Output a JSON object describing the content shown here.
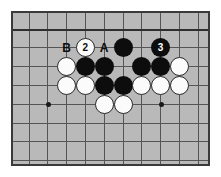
{
  "diagram": {
    "kind": "go-board-diagram",
    "board": {
      "background_color": "#b9b9b9",
      "line_color": "#555555",
      "edge_line_color": "#2e2e2e",
      "frame_color": "#3a3a3a",
      "cell_size": 18.8,
      "origin_x": 16,
      "origin_y": 16,
      "columns": 10,
      "rows": 8,
      "top_edge_is_board_edge": true,
      "left_edge_is_board_edge": false
    },
    "star_points": [
      {
        "col": 1,
        "row": 4
      },
      {
        "col": 7,
        "row": 4
      }
    ],
    "stones": [
      {
        "col": 5,
        "row": 1,
        "color": "black",
        "label": ""
      },
      {
        "col": 7,
        "row": 1,
        "color": "black",
        "label": "3"
      },
      {
        "col": 3,
        "row": 1,
        "color": "white",
        "label": "2"
      },
      {
        "col": 2,
        "row": 2,
        "color": "white",
        "label": ""
      },
      {
        "col": 3,
        "row": 2,
        "color": "black",
        "label": ""
      },
      {
        "col": 4,
        "row": 2,
        "color": "black",
        "label": ""
      },
      {
        "col": 6,
        "row": 2,
        "color": "black",
        "label": ""
      },
      {
        "col": 7,
        "row": 2,
        "color": "black",
        "label": ""
      },
      {
        "col": 8,
        "row": 2,
        "color": "white",
        "label": ""
      },
      {
        "col": 2,
        "row": 3,
        "color": "white",
        "label": ""
      },
      {
        "col": 3,
        "row": 3,
        "color": "white",
        "label": ""
      },
      {
        "col": 4,
        "row": 3,
        "color": "black",
        "label": ""
      },
      {
        "col": 5,
        "row": 3,
        "color": "black",
        "label": ""
      },
      {
        "col": 6,
        "row": 3,
        "color": "white",
        "label": ""
      },
      {
        "col": 7,
        "row": 3,
        "color": "white",
        "label": ""
      },
      {
        "col": 8,
        "row": 3,
        "color": "white",
        "label": ""
      },
      {
        "col": 4,
        "row": 4,
        "color": "white",
        "label": ""
      },
      {
        "col": 5,
        "row": 4,
        "color": "white",
        "label": ""
      }
    ],
    "point_labels": [
      {
        "col": 2,
        "row": 1,
        "text": "B"
      },
      {
        "col": 4,
        "row": 1,
        "text": "A"
      }
    ],
    "move_numbers": {
      "two": "2",
      "three": "3"
    },
    "letters": {
      "a": "A",
      "b": "B"
    }
  }
}
